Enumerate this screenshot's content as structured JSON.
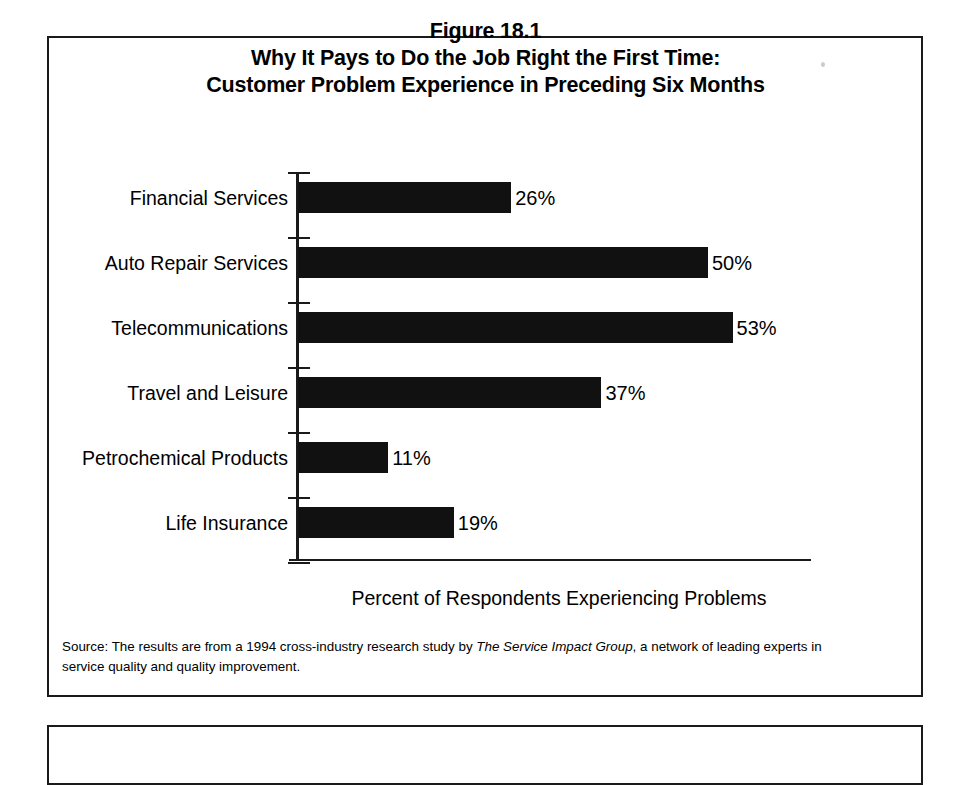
{
  "figure": {
    "number": "Figure 18.1",
    "title_line_1": "Why It Pays to Do the Job Right the First Time:",
    "title_line_2": "Customer Problem Experience in Preceding Six Months",
    "source_prefix": "Source: The results are from a 1994 cross-industry research study by ",
    "source_italic": "The Service Impact Group",
    "source_suffix": ", a network of leading experts in service quality and quality improvement."
  },
  "chart_data": {
    "type": "bar",
    "orientation": "horizontal",
    "xlabel": "Percent of Respondents Experiencing Problems",
    "ylabel": "",
    "categories": [
      "Financial Services",
      "Auto Repair Services",
      "Telecommunications",
      "Travel and Leisure",
      "Petrochemical Products",
      "Life Insurance"
    ],
    "values": [
      26,
      50,
      53,
      37,
      11,
      19
    ],
    "value_labels": [
      "26%",
      "50%",
      "53%",
      "37%",
      "11%",
      "19%"
    ],
    "xlim": [
      0,
      64
    ],
    "grid": false,
    "legend": false,
    "bar_color": "#111111",
    "background_color": "#ffffff"
  }
}
